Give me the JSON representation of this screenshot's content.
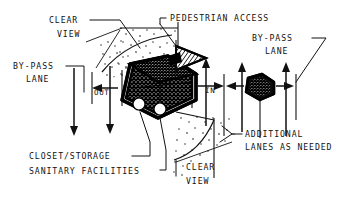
{
  "diagram": {
    "ink_color": "#111111",
    "background_color": "#ffffff",
    "labels": {
      "clear_view_top_line1": "CLEAR",
      "clear_view_top_line2": "VIEW",
      "bypass_lane_left_line1": "BY-PASS",
      "bypass_lane_left_line2": "LANE",
      "pedestrian_access": "PEDESTRIAN ACCESS",
      "bypass_lane_right_line1": "BY-PASS",
      "bypass_lane_right_line2": "LANE",
      "out": "OUT",
      "in": "IN",
      "additional_lanes_line1": "ADDITIONAL",
      "additional_lanes_line2": "LANES AS NEEDED",
      "closet_storage": "CLOSET/STORAGE",
      "sanitary_facilities": "SANITARY FACILITIES",
      "clear_view_bottom_line1": "CLEAR",
      "clear_view_bottom_line2": "VIEW"
    }
  }
}
